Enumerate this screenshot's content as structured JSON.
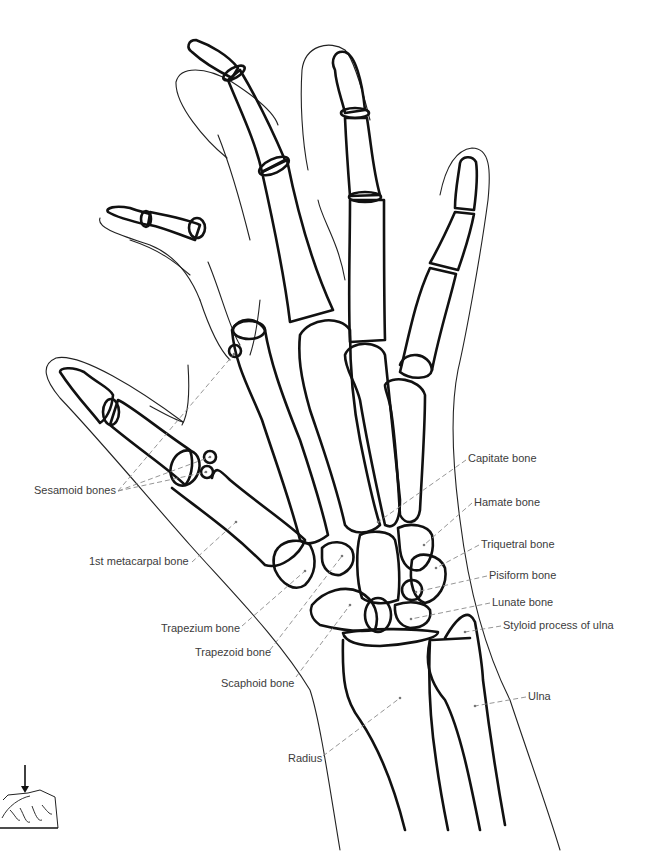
{
  "figure": {
    "colors": {
      "bone_stroke": "#111111",
      "skin_stroke": "#222222",
      "leader": "#8a8a8a",
      "label_text": "#3c3c3c",
      "background": "#ffffff"
    }
  },
  "labels": [
    {
      "id": "capitate",
      "text": "Capitate bone",
      "x": 468,
      "y": 452
    },
    {
      "id": "hamate",
      "text": "Hamate bone",
      "x": 474,
      "y": 496
    },
    {
      "id": "triquetral",
      "text": "Triquetral bone",
      "x": 481,
      "y": 538
    },
    {
      "id": "pisiform",
      "text": "Pisiform bone",
      "x": 489,
      "y": 569
    },
    {
      "id": "lunate",
      "text": "Lunate bone",
      "x": 492,
      "y": 596
    },
    {
      "id": "styloid",
      "text": "Styloid process of ulna",
      "x": 503,
      "y": 619
    },
    {
      "id": "ulna",
      "text": "Ulna",
      "x": 528,
      "y": 690
    },
    {
      "id": "radius",
      "text": "Radius",
      "x": 288,
      "y": 752
    },
    {
      "id": "sesamoid",
      "text": "Sesamoid bones",
      "x": 34,
      "y": 484
    },
    {
      "id": "first-metacarpal",
      "text": "1st metacarpal bone",
      "x": 89,
      "y": 555
    },
    {
      "id": "trapezium",
      "text": "Trapezium bone",
      "x": 161,
      "y": 622
    },
    {
      "id": "trapezoid",
      "text": "Trapezoid bone",
      "x": 195,
      "y": 646
    },
    {
      "id": "scaphoid",
      "text": "Scaphoid bone",
      "x": 221,
      "y": 677
    }
  ],
  "inset": {
    "description": "Small orientation sketch: hand resting on plate with arrow indicating beam direction"
  }
}
